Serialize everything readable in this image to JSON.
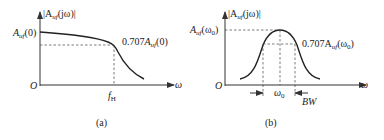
{
  "panel_a": {
    "y_label": "|A",
    "y_label_sub": "uf",
    "y_label_tail": "(jω)|",
    "y_tick_main": "A",
    "y_tick_sub": "uf",
    "y_tick_tail": "(0)",
    "annotation_pre": "0.707",
    "annotation_main": "A",
    "annotation_sub": "uf",
    "annotation_tail": "(0)",
    "origin": "O",
    "x_label": "ω",
    "x_tick_main": "f",
    "x_tick_sub": "H",
    "caption": "(a)"
  },
  "panel_b": {
    "y_label": "|A",
    "y_label_sub": "uf",
    "y_label_tail": "(jω)|",
    "y_tick_main": "A",
    "y_tick_sub": "uf",
    "y_tick_tail": "(ω",
    "y_tick_sub2": "0",
    "y_tick_close": ")",
    "annotation_pre": "0.707A",
    "annotation_sub": "uf",
    "annotation_tail": "(ω",
    "annotation_sub2": "0",
    "annotation_close": ")",
    "origin": "O",
    "x_label": "ω",
    "center_main": "ω",
    "center_sub": "0",
    "bandwidth": "BW",
    "caption": "(b)"
  }
}
